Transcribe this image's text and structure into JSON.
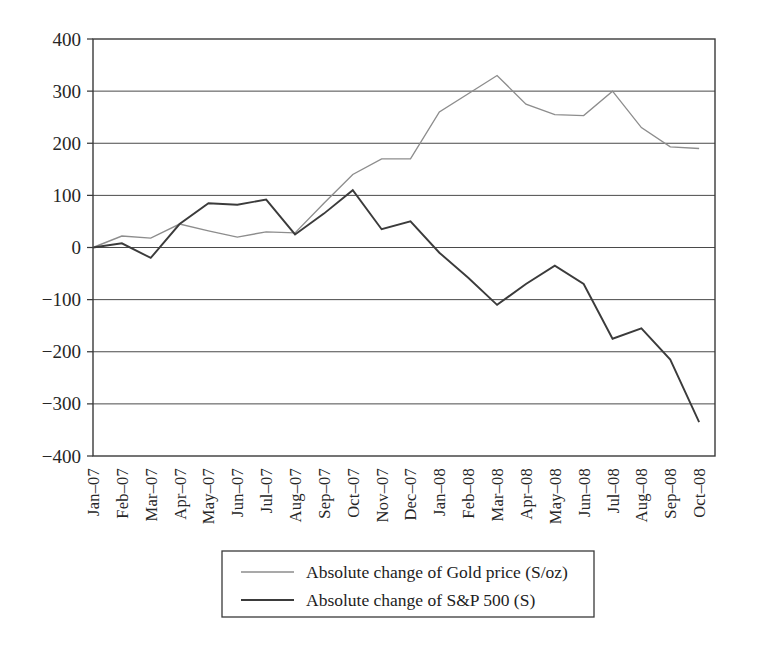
{
  "chart_data": {
    "type": "line",
    "title": "",
    "subtitle": "",
    "xlabel": "",
    "ylabel": "",
    "ylim": [
      -400,
      400
    ],
    "yticks": [
      400,
      300,
      200,
      100,
      0,
      -100,
      -200,
      -300,
      -400
    ],
    "ytick_labels": [
      "400",
      "300",
      "200",
      "100",
      "0",
      "−100",
      "−200",
      "−300",
      "−400"
    ],
    "grid": "horizontal",
    "legend_position": "bottom-center",
    "categories": [
      "Jan–07",
      "Feb–07",
      "Mar–07",
      "Apr–07",
      "May–07",
      "Jun–07",
      "Jul–07",
      "Aug–07",
      "Sep–07",
      "Oct–07",
      "Nov–07",
      "Dec–07",
      "Jan–08",
      "Feb–08",
      "Mar–08",
      "Apr–08",
      "May–08",
      "Jun–08",
      "Jul–08",
      "Aug–08",
      "Sep–08",
      "Oct–08"
    ],
    "series": [
      {
        "name": "Absolute change of Gold price (S/oz)",
        "color": "#8d8d8d",
        "values": [
          0,
          22,
          18,
          45,
          32,
          20,
          30,
          28,
          85,
          140,
          170,
          170,
          260,
          295,
          330,
          275,
          255,
          253,
          300,
          230,
          193,
          190
        ]
      },
      {
        "name": "Absolute change of S&P 500 (S)",
        "color": "#3b3b3b",
        "values": [
          0,
          8,
          -20,
          45,
          85,
          82,
          92,
          25,
          65,
          110,
          35,
          50,
          -10,
          -58,
          -110,
          -70,
          -35,
          -70,
          -175,
          -155,
          -215,
          -335
        ]
      }
    ]
  },
  "legend": {
    "entries": [
      {
        "label": "Absolute change of Gold price (S/oz)",
        "series": "gold"
      },
      {
        "label": "Absolute change of S&P 500 (S)",
        "series": "sp500"
      }
    ]
  }
}
